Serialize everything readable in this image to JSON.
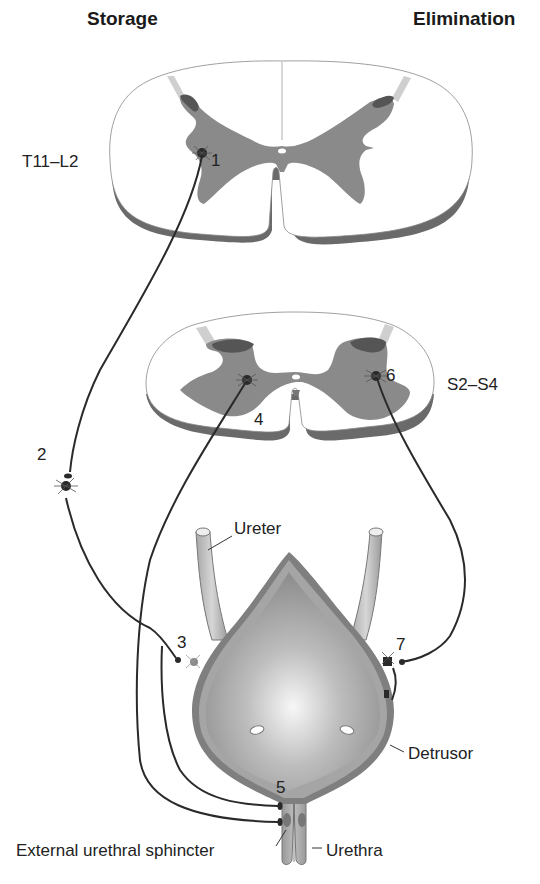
{
  "headers": {
    "left": "Storage",
    "right": "Elimination"
  },
  "spinal_levels": {
    "upper": "T11–L2",
    "lower": "S2–S4"
  },
  "neuron_numbers": {
    "n1": "1",
    "n2": "2",
    "n3": "3",
    "n4": "4",
    "n5": "5",
    "n6": "6",
    "n7": "7"
  },
  "anatomy_labels": {
    "ureter": "Ureter",
    "detrusor": "Detrusor",
    "external_sphincter": "External urethral sphincter",
    "urethra": "Urethra"
  },
  "colors": {
    "gray_matter": "#8a8a8a",
    "dorsal_horn_dark": "#555555",
    "cord_rim": "#6a6a6a",
    "nerve_line": "#2a2a2a",
    "bladder_center": "#f4f4f4",
    "bladder_edge": "#8c8c8c"
  }
}
